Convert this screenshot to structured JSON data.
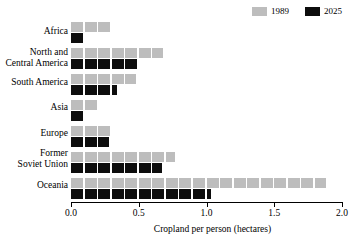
{
  "chart_data": {
    "type": "bar",
    "orientation": "horizontal",
    "title": "",
    "subtitle": "",
    "xlabel": "Cropland per person (hectares)",
    "ylabel": "",
    "xlim": [
      0.0,
      2.0
    ],
    "xticks": [
      0.0,
      0.5,
      1.0,
      1.5,
      2.0
    ],
    "xtick_labels": [
      "0.0",
      "0.5",
      "1.0",
      "1.5",
      "2.0"
    ],
    "grid": false,
    "legend_position": "top-right",
    "style": "segmented-pictogram-bars",
    "categories": [
      "Africa",
      "North and\nCentral America",
      "South America",
      "Asia",
      "Europe",
      "Former\nSoviet Union",
      "Oceania"
    ],
    "series": [
      {
        "name": "1989",
        "color": "#bdbdbd",
        "values": [
          0.29,
          0.68,
          0.48,
          0.19,
          0.29,
          0.77,
          1.88
        ]
      },
      {
        "name": "2025",
        "color": "#0d0d0d",
        "values": [
          0.1,
          0.49,
          0.34,
          0.09,
          0.28,
          0.67,
          1.03
        ]
      }
    ]
  },
  "legend": {
    "entries": [
      {
        "label": "1989",
        "color": "#bdbdbd"
      },
      {
        "label": "2025",
        "color": "#0d0d0d"
      }
    ]
  },
  "axis": {
    "x_label": "Cropland per person (hectares)",
    "tick_labels": [
      "0.0",
      "0.5",
      "1.0",
      "1.5",
      "2.0"
    ]
  },
  "colors": {
    "series_1989": "#bdbdbd",
    "series_2025": "#0d0d0d",
    "axis": "#000000",
    "background": "#ffffff"
  }
}
